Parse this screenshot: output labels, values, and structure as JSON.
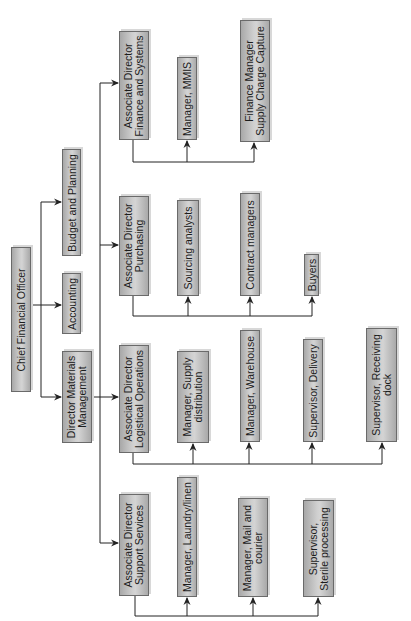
{
  "diagram": {
    "type": "org-chart",
    "orientation": "rotated-90-ccw",
    "colors": {
      "box_fill": "#c4c4c4",
      "box_border": "#6a6a6a",
      "line": "#222222",
      "text": "#1c1c1c"
    },
    "root": {
      "id": "cfo",
      "label": [
        "Chief Financial Officer"
      ],
      "children": [
        {
          "id": "budget",
          "label": [
            "Budget and Planning"
          ]
        },
        {
          "id": "accounting",
          "label": [
            "Accounting"
          ]
        },
        {
          "id": "dir_materials",
          "label": [
            "Director Materials",
            "Management"
          ],
          "children": [
            {
              "id": "ad_finance",
              "label": [
                "Associate Director",
                "Finance and Systems"
              ],
              "children": [
                {
                  "id": "mgr_mmis",
                  "label": [
                    "Manager, MMIS"
                  ]
                },
                {
                  "id": "fin_mgr_scc",
                  "label": [
                    "Finance Manager",
                    "Supply Charge Capture"
                  ]
                }
              ]
            },
            {
              "id": "ad_purchasing",
              "label": [
                "Associate Director",
                "Purchasing"
              ],
              "children": [
                {
                  "id": "sourcing",
                  "label": [
                    "Sourcing analysts"
                  ]
                },
                {
                  "id": "contract",
                  "label": [
                    "Contract managers"
                  ]
                },
                {
                  "id": "buyers",
                  "label": [
                    "Buyers"
                  ]
                }
              ]
            },
            {
              "id": "ad_logistics",
              "label": [
                "Associate Director",
                "Logistical Operations"
              ],
              "children": [
                {
                  "id": "mgr_supply",
                  "label": [
                    "Manager, Supply",
                    "distribution"
                  ]
                },
                {
                  "id": "mgr_warehouse",
                  "label": [
                    "Manager, Warehouse"
                  ]
                },
                {
                  "id": "sup_delivery",
                  "label": [
                    "Supervisor, Delivery"
                  ]
                },
                {
                  "id": "sup_receiving",
                  "label": [
                    "Supervisor, Receiving",
                    "dock"
                  ]
                }
              ]
            },
            {
              "id": "ad_support",
              "label": [
                "Associate Director",
                "Support Services"
              ],
              "children": [
                {
                  "id": "mgr_laundry",
                  "label": [
                    "Manager, Laundry/linen"
                  ]
                },
                {
                  "id": "mgr_mail",
                  "label": [
                    "Manager, Mail and",
                    "courier"
                  ]
                },
                {
                  "id": "sup_sterile",
                  "label": [
                    "Supervisor,",
                    "Sterile processing"
                  ]
                }
              ]
            }
          ]
        }
      ]
    }
  },
  "nodes": {
    "cfo": {
      "l1": "Chief Financial Officer"
    },
    "budget": {
      "l1": "Budget and Planning"
    },
    "accounting": {
      "l1": "Accounting"
    },
    "dir_materials": {
      "l1": "Director Materials",
      "l2": "Management"
    },
    "ad_finance": {
      "l1": "Associate Director",
      "l2": "Finance and Systems"
    },
    "mgr_mmis": {
      "l1": "Manager, MMIS"
    },
    "fin_mgr_scc": {
      "l1": "Finance Manager",
      "l2": "Supply Charge Capture"
    },
    "ad_purchasing": {
      "l1": "Associate Director",
      "l2": "Purchasing"
    },
    "sourcing": {
      "l1": "Sourcing analysts"
    },
    "contract": {
      "l1": "Contract managers"
    },
    "buyers": {
      "l1": "Buyers"
    },
    "ad_logistics": {
      "l1": "Associate Director",
      "l2": "Logistical Operations"
    },
    "mgr_supply": {
      "l1": "Manager, Supply",
      "l2": "distribution"
    },
    "mgr_warehouse": {
      "l1": "Manager, Warehouse"
    },
    "sup_delivery": {
      "l1": "Supervisor, Delivery"
    },
    "sup_receiving": {
      "l1": "Supervisor, Receiving",
      "l2": "dock"
    },
    "ad_support": {
      "l1": "Associate Director",
      "l2": "Support Services"
    },
    "mgr_laundry": {
      "l1": "Manager, Laundry/linen"
    },
    "mgr_mail": {
      "l1": "Manager, Mail and",
      "l2": "courier"
    },
    "sup_sterile": {
      "l1": "Supervisor,",
      "l2": "Sterile processing"
    }
  }
}
